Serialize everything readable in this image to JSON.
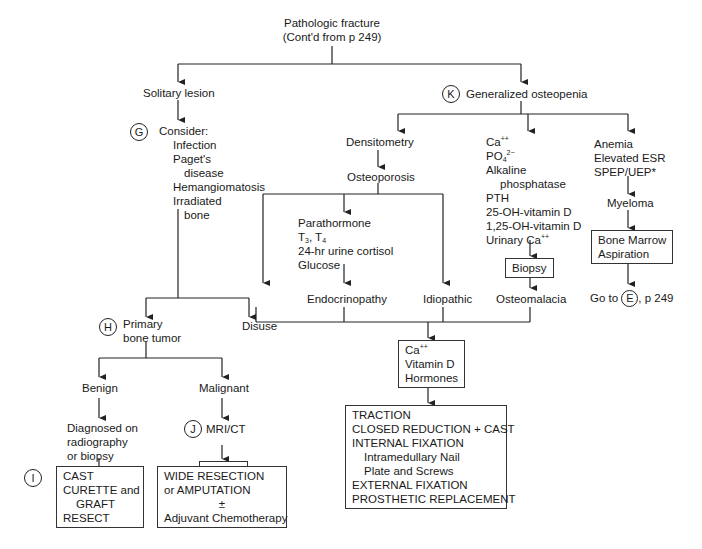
{
  "title": {
    "line1": "Pathologic fracture",
    "line2": "(Cont'd from p 249)"
  },
  "left": {
    "solitary": "Solitary lesion",
    "g_marker": "G",
    "consider": "Consider:",
    "consider_items": [
      "Infection",
      "Paget's",
      "disease",
      "Hemangiomatosis",
      "Irradiated",
      "bone"
    ],
    "h_marker": "H",
    "primary_tumor": [
      "Primary",
      "bone tumor"
    ],
    "benign": "Benign",
    "malignant": "Malignant",
    "diagnosed": [
      "Diagnosed on",
      "radiography",
      "or biopsy"
    ],
    "j_marker": "J",
    "mri_ct": "MRI/CT",
    "biopsy": "Biopsy",
    "i_marker": "I",
    "benign_tx": [
      "CAST",
      "CURETTE and",
      "GRAFT",
      "RESECT"
    ],
    "malignant_tx": [
      "WIDE RESECTION",
      "or AMPUTATION",
      "±",
      "Adjuvant Chemotherapy"
    ]
  },
  "right": {
    "k_marker": "K",
    "generalized": "Generalized osteopenia",
    "densitometry": "Densitometry",
    "osteoporosis": "Osteoporosis",
    "endo_tests": {
      "parathormone": "Parathormone",
      "t3": "T",
      "t3sub": "3",
      "t4": ", T",
      "t4sub": "4",
      "cortisol": "24-hr urine cortisol",
      "glucose": "Glucose"
    },
    "disuse": "Disuse",
    "endocrinopathy": "Endocrinopathy",
    "idiopathic": "Idiopathic",
    "labs": {
      "ca": "Ca",
      "ca_sup": "++",
      "po": "PO",
      "po_sub": "4",
      "po_sup": "2−",
      "alk1": "Alkaline",
      "alk2": "phosphatase",
      "pth": "PTH",
      "vitd25": "25-OH-vitamin D",
      "vitd125": "1,25-OH-vitamin D",
      "urinary": "Urinary Ca",
      "urinary_sup": "++"
    },
    "biopsy": "Biopsy",
    "osteomalacia": "Osteomalacia",
    "myeloma_tests": [
      "Anemia",
      "Elevated ESR",
      "SPEP/UEP*"
    ],
    "myeloma": "Myeloma",
    "bone_marrow": [
      "Bone Marrow",
      "Aspiration"
    ],
    "goto": {
      "prefix": "Go to",
      "marker": "E",
      "suffix": ", p 249"
    },
    "supplement": {
      "ca": "Ca",
      "ca_sup": "++",
      "vitd": "Vitamin D",
      "hormones": "Hormones"
    },
    "treatment": {
      "traction": "TRACTION",
      "closed": "CLOSED REDUCTION + CAST",
      "internal": "INTERNAL FIXATION",
      "nail": "Intramedullary Nail",
      "plate": "Plate and Screws",
      "external": "EXTERNAL FIXATION",
      "prosthetic": "PROSTHETIC REPLACEMENT"
    }
  }
}
